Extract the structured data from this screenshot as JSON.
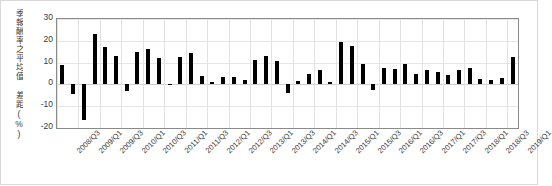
{
  "chart_data": {
    "type": "bar",
    "title": "",
    "xlabel": "",
    "ylabel": "季報酬率之平均值 差距(%)",
    "ylim": [
      -20,
      30
    ],
    "ytick_labels": [
      "30",
      "20",
      "10",
      "0",
      "-10",
      "-20"
    ],
    "ytick_values": [
      30,
      20,
      10,
      0,
      -10,
      -20
    ],
    "grid": true,
    "legend": "none",
    "bar_color": "#000000",
    "categories": [
      "2008/Q3",
      "2008/Q4",
      "2009/Q1",
      "2009/Q2",
      "2009/Q3",
      "2009/Q4",
      "2010/Q1",
      "2010/Q2",
      "2010/Q3",
      "2010/Q4",
      "2011/Q1",
      "2011/Q2",
      "2011/Q3",
      "2011/Q4",
      "2012/Q1",
      "2012/Q2",
      "2012/Q3",
      "2012/Q4",
      "2013/Q1",
      "2013/Q2",
      "2013/Q3",
      "2013/Q4",
      "2014/Q1",
      "2014/Q2",
      "2014/Q3",
      "2014/Q4",
      "2015/Q1",
      "2015/Q2",
      "2015/Q3",
      "2015/Q4",
      "2016/Q1",
      "2016/Q2",
      "2016/Q3",
      "2016/Q4",
      "2017/Q1",
      "2017/Q2",
      "2017/Q3",
      "2017/Q4",
      "2018/Q1",
      "2018/Q2",
      "2018/Q3",
      "2018/Q4",
      "2019/Q1"
    ],
    "values": [
      9.0,
      -4.5,
      -16.5,
      23.2,
      17.0,
      13.0,
      -3.0,
      14.8,
      16.2,
      12.0,
      0.3,
      12.5,
      14.2,
      4.0,
      1.0,
      3.2,
      3.5,
      1.9,
      11.0,
      12.8,
      10.8,
      -4.0,
      1.6,
      4.8,
      6.8,
      1.3,
      19.5,
      17.5,
      9.5,
      -2.5,
      7.5,
      7.0,
      9.5,
      5.0,
      6.5,
      5.8,
      4.2,
      6.8,
      7.5,
      2.5,
      2.2,
      3.0,
      12.5
    ],
    "xtick_labels": [
      "2008/Q3",
      "2009/Q1",
      "2009/Q3",
      "2010/Q1",
      "2010/Q3",
      "2011/Q1",
      "2011/Q3",
      "2012/Q1",
      "2012/Q3",
      "2013/Q1",
      "2013/Q3",
      "2014/Q1",
      "2014/Q3",
      "2015/Q1",
      "2015/Q3",
      "2016/Q1",
      "2016/Q3",
      "2017/Q1",
      "2017/Q3",
      "2018/Q1",
      "2018/Q3",
      "2019/Q1"
    ],
    "xtick_indices": [
      0,
      2,
      4,
      6,
      8,
      10,
      12,
      14,
      16,
      18,
      20,
      22,
      24,
      26,
      28,
      30,
      32,
      34,
      36,
      38,
      40,
      42
    ]
  }
}
